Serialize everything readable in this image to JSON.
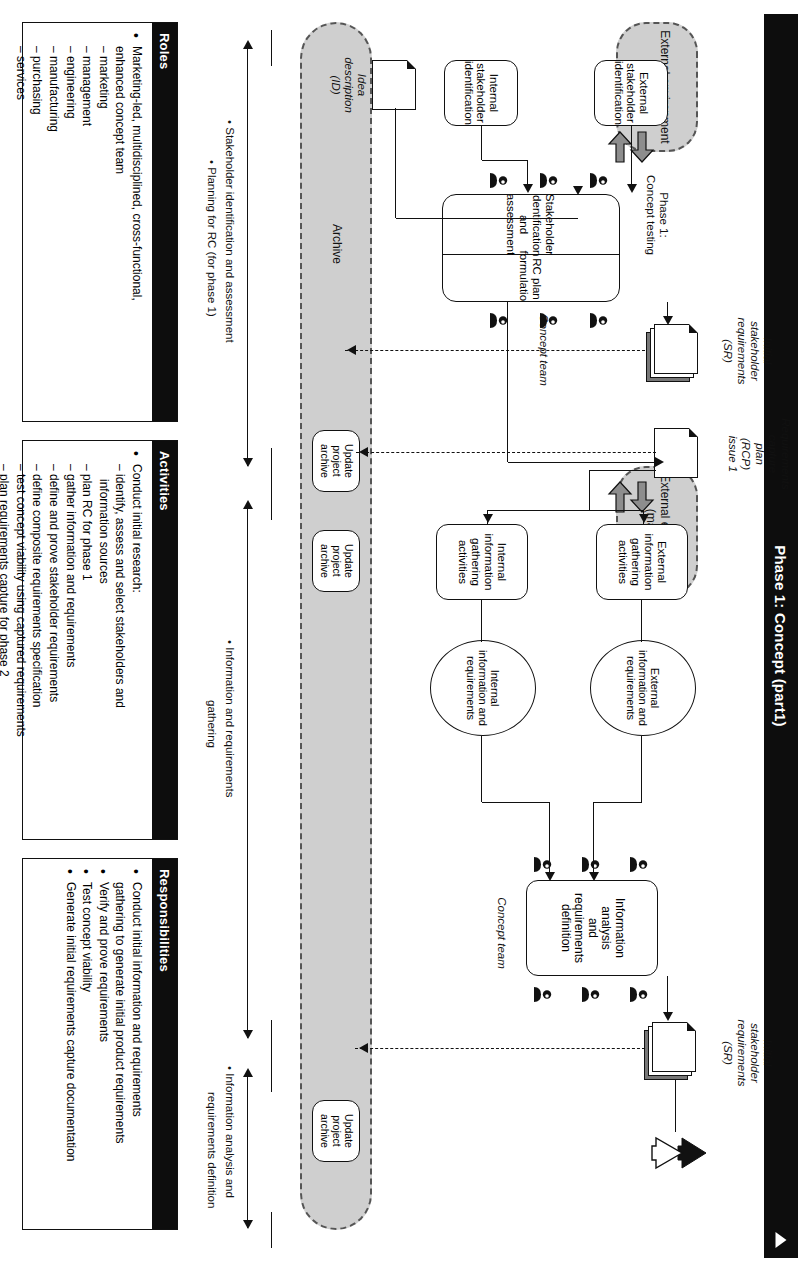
{
  "title": "Phase 1: Concept (part1)",
  "lanes": {
    "archive": "Archive",
    "external_env_top": "External environment\n(market)",
    "external_env_bottom": "External environment\n(market)"
  },
  "process": {
    "info_analysis": "Information analysis\nand requirements\ndefinition",
    "external_gathering": "External\ninformation\ngathering\nactivities",
    "internal_gathering": "Internal\ninformation\ngathering\nactivities",
    "external_info_oval": "External\ninformation and\nrequirements",
    "internal_info_oval": "Internal\ninformation and\nrequirements",
    "stakeholder_id_assessment": "Stakeholder identification\nand assessment",
    "rc_plan_formulation": "RC plan formulation",
    "external_stakeholder_id": "External\nstakeholder\nidentification",
    "internal_stakeholder_id": "Internal\nstakeholder\nidentification",
    "update_archive_1": "Update\nproject\narchive",
    "update_archive_2": "Update\nproject\narchive",
    "update_archive_3": "Update\nproject\narchive"
  },
  "artifacts": {
    "idea_description": "Idea\ndescription\n(ID)",
    "initial_sr_bottom": "Initial\nstakeholder\nrequirements\n(SR)",
    "rcp": "Requirements\ncapture\nplan\n(RCP)\nissue 1",
    "initial_sr_top": "Initial\nstakeholder\nrequirements\n(SR)"
  },
  "annotations": {
    "concept_team_top": "Concept team",
    "concept_team_bottom": "Concept team",
    "phase_concept_testing": "Phase 1:\nConcept testing"
  },
  "brackets": [
    {
      "label": "• Information analysis and\n  requirements definition"
    },
    {
      "label": "• Information and requirements\n  gathering"
    },
    {
      "label": "• Stakeholder identification and assessment\n  • Planning for RC (for phase 1)"
    }
  ],
  "bracket_labels": {
    "b1_l1": "• Information analysis and",
    "b1_l2": "requirements definition",
    "b2_l1": "• Information and requirements",
    "b2_l2": "gathering",
    "b3_l1": "• Stakeholder identification and assessment",
    "b3_l2": "• Planning for RC (for phase 1)"
  },
  "panels": {
    "roles": {
      "header": "Roles",
      "items": [
        {
          "type": "bullet",
          "text": "Marketing-led, multidisciplined, cross-functional,"
        },
        {
          "type": "cont",
          "text": "enhanced concept team"
        },
        {
          "type": "sub",
          "text": "marketing"
        },
        {
          "type": "sub",
          "text": "management"
        },
        {
          "type": "sub",
          "text": "engineering"
        },
        {
          "type": "sub",
          "text": "manufacturing"
        },
        {
          "type": "sub",
          "text": "purchasing"
        },
        {
          "type": "sub",
          "text": "services"
        }
      ]
    },
    "activities": {
      "header": "Activities",
      "items": [
        {
          "type": "bullet",
          "text": "Conduct initial research:"
        },
        {
          "type": "sub",
          "text": "identify, assess and select stakeholders and"
        },
        {
          "type": "cont2",
          "text": "information sources"
        },
        {
          "type": "sub",
          "text": "plan RC for phase 1"
        },
        {
          "type": "sub",
          "text": "gather information and requirements"
        },
        {
          "type": "sub",
          "text": "define and prove stakeholder requirements"
        },
        {
          "type": "sub",
          "text": "define composite requirements specification"
        },
        {
          "type": "sub",
          "text": "test concept viability using captured requirements"
        },
        {
          "type": "sub",
          "text": "plan requirements capture for phase 2"
        }
      ]
    },
    "responsibilities": {
      "header": "Responsibilities",
      "items": [
        {
          "type": "bullet",
          "text": "Conduct initial information and requirements"
        },
        {
          "type": "cont",
          "text": "gathering to generate initial product requirements"
        },
        {
          "type": "bullet",
          "text": "Verify and prove requirements"
        },
        {
          "type": "bullet",
          "text": "Test concept viability"
        },
        {
          "type": "bullet",
          "text": "Generate initial requirements capture documentation"
        }
      ]
    }
  },
  "colors": {
    "ink": "#111111",
    "lane_fill": "#cfcfcf",
    "header_bg": "#0d0d0d",
    "block_arrow": "#8d8d8d"
  }
}
